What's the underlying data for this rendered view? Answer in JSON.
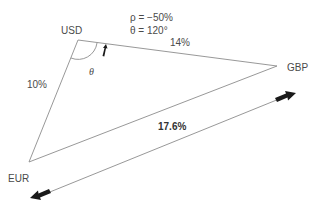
{
  "diagram": {
    "nodes": [
      {
        "id": "usd",
        "label": "USD"
      },
      {
        "id": "gbp",
        "label": "GBP"
      },
      {
        "id": "eur",
        "label": "EUR"
      }
    ],
    "edges": [
      {
        "from": "usd",
        "to": "eur",
        "label": "10%"
      },
      {
        "from": "usd",
        "to": "gbp",
        "label": "14%"
      },
      {
        "from": "eur",
        "to": "gbp",
        "label": "17.6%"
      }
    ],
    "params": {
      "rho": "ρ = −50%",
      "theta_value": "θ = 120°"
    },
    "angle_label": "θ",
    "colors": {
      "line": "#8c8c8c",
      "arrow": "#1a1a1a",
      "text": "#4a4a4a"
    }
  }
}
